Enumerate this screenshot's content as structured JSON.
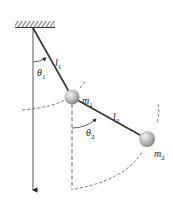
{
  "diagram": {
    "labels": {
      "theta1": {
        "base": "θ",
        "sub": "1"
      },
      "theta2": {
        "base": "θ",
        "sub": "2"
      },
      "l1": {
        "base": "l",
        "sub": "1"
      },
      "l2": {
        "base": "l",
        "sub": "2"
      },
      "m1": {
        "base": "m",
        "sub": "1"
      },
      "m2": {
        "base": "m",
        "sub": "2"
      }
    },
    "colors": {
      "line": "#333333",
      "dash": "#555555",
      "ball_light": "#f2f2f2",
      "ball_dark": "#8a8a8a"
    }
  }
}
